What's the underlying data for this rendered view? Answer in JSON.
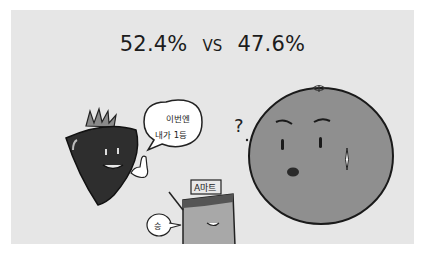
{
  "headline": {
    "left_value": "52.4%",
    "vs_label": "VS",
    "right_value": "47.6%"
  },
  "illustration": {
    "strawberry_speech": {
      "line1": "이번엔",
      "line2": "내가 1등"
    },
    "box_sign": "A마트",
    "box_speech": "승",
    "orange_thought": "?"
  },
  "colors": {
    "panel_bg": "#e6e6e6",
    "strawberry": "#2e2e2e",
    "orange": "#8f8f8f",
    "box": "#a8a8a8",
    "text": "#1c1c1c"
  }
}
